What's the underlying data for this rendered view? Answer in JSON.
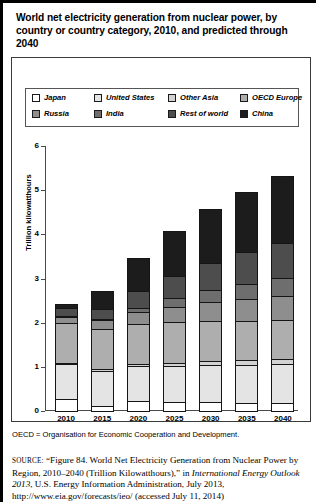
{
  "figure": {
    "title": "World net electricity generation from nuclear power, by country or country category, 2010, and predicted through 2040",
    "footnote": "OECD = Organisation for Economic Cooperation and Development.",
    "source_label": "SOURCE:",
    "source_part1": "“Figure 84. World Net Electricity Generation from Nuclear Power by Region, 2010–2040 (Trillion Kilowatthours),” in ",
    "source_italic1": "International Energy Outlook 2013",
    "source_part2": ", U.S. Energy Information Administration,",
    "source_part3": "July 2013, http://www.eia.gov/forecasts/ieo/ (accessed July 11, 2014)"
  },
  "chart_data": {
    "type": "bar",
    "stacked": true,
    "title": "World net electricity generation from nuclear power, by country or country category, 2010, and predicted through 2040",
    "xlabel": "",
    "ylabel": "Trillion kilowatthours",
    "ylim": [
      0,
      6
    ],
    "yticks": [
      "0",
      "1",
      "2",
      "3",
      "4",
      "5",
      "6"
    ],
    "grid": false,
    "legend_position": "top",
    "categories": [
      "2010",
      "2015",
      "2020",
      "2025",
      "2030",
      "2035",
      "2040"
    ],
    "series": [
      {
        "name": "Japan",
        "color": "#ffffff",
        "values": [
          0.3,
          0.13,
          0.24,
          0.22,
          0.22,
          0.21,
          0.21
        ]
      },
      {
        "name": "United States",
        "color": "#e4e4e4",
        "values": [
          0.81,
          0.83,
          0.82,
          0.84,
          0.86,
          0.88,
          0.89
        ]
      },
      {
        "name": "Other Asia",
        "color": "#d2d2d2",
        "values": [
          0.05,
          0.06,
          0.08,
          0.1,
          0.12,
          0.13,
          0.15
        ]
      },
      {
        "name": "OECD Europe",
        "color": "#aeaeae",
        "values": [
          0.92,
          0.93,
          0.92,
          0.95,
          0.94,
          0.92,
          0.9
        ]
      },
      {
        "name": "Russia",
        "color": "#8e8e8e",
        "values": [
          0.17,
          0.22,
          0.29,
          0.36,
          0.44,
          0.5,
          0.56
        ]
      },
      {
        "name": "India",
        "color": "#6e6e6e",
        "values": [
          0.03,
          0.06,
          0.13,
          0.22,
          0.3,
          0.38,
          0.44
        ]
      },
      {
        "name": "Rest of world",
        "color": "#4d4d4d",
        "values": [
          0.19,
          0.25,
          0.39,
          0.52,
          0.64,
          0.73,
          0.81
        ]
      },
      {
        "name": "China",
        "color": "#1c1c1c",
        "values": [
          0.13,
          0.42,
          0.78,
          1.04,
          1.23,
          1.4,
          1.54
        ]
      }
    ],
    "totals": [
      2.6,
      2.9,
      3.65,
      4.25,
      4.75,
      5.15,
      5.5
    ]
  },
  "legend": {
    "rows": [
      [
        {
          "label": "Japan",
          "color": "#ffffff"
        },
        {
          "label": "United States",
          "color": "#e4e4e4"
        },
        {
          "label": "Other Asia",
          "color": "#d2d2d2"
        },
        {
          "label": "OECD Europe",
          "color": "#aeaeae"
        }
      ],
      [
        {
          "label": "Russia",
          "color": "#8e8e8e"
        },
        {
          "label": "India",
          "color": "#6e6e6e"
        },
        {
          "label": "Rest of world",
          "color": "#4d4d4d"
        },
        {
          "label": "China",
          "color": "#1c1c1c"
        }
      ]
    ]
  }
}
